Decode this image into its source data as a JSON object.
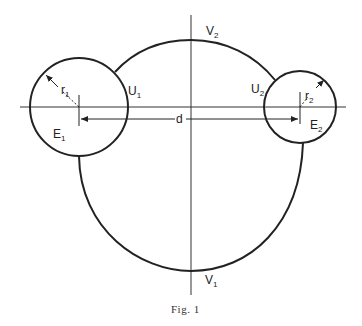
{
  "figure": {
    "caption": "Fig. 1",
    "colors": {
      "stroke": "#222222",
      "background": "#ffffff"
    }
  },
  "labels": {
    "v1": {
      "main": "V",
      "sub": "1"
    },
    "v2": {
      "main": "V",
      "sub": "2"
    },
    "u1": {
      "main": "U",
      "sub": "1"
    },
    "u2": {
      "main": "U",
      "sub": "2"
    },
    "e1": {
      "main": "E",
      "sub": "1"
    },
    "e2": {
      "main": "E",
      "sub": "2"
    },
    "r1": {
      "main": "r",
      "sub": "1"
    },
    "r2": {
      "main": "r",
      "sub": "2"
    },
    "d": "d"
  }
}
